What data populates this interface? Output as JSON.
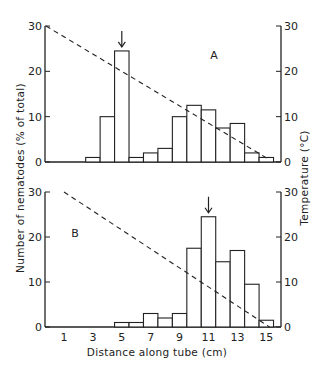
{
  "chart_data": {
    "type": "bar",
    "xlabel": "Distance along tube (cm)",
    "ylabel_left": "Number of nematodes (% of total)",
    "ylabel_right": "Temperature (°C)",
    "x_tick_labels": [
      "1",
      "3",
      "5",
      "7",
      "9",
      "11",
      "13",
      "15"
    ],
    "x_range": [
      0.5,
      15.5
    ],
    "panels": [
      {
        "label": "A",
        "ylim": [
          0,
          30
        ],
        "y_ticks": [
          "0",
          "10",
          "20",
          "30"
        ],
        "y2_ticks": [
          "0",
          "10",
          "20",
          "30"
        ],
        "categories": [
          3,
          4,
          5,
          6,
          7,
          8,
          9,
          10,
          11,
          12,
          13,
          14,
          15
        ],
        "values": [
          1,
          10,
          24.5,
          1,
          2,
          3,
          10,
          12.5,
          11.5,
          7.5,
          8.5,
          2,
          1
        ],
        "arrow_at": 5,
        "temperature_line": {
          "style": "dashed",
          "from": {
            "x": 0.5,
            "temp": 30
          },
          "to": {
            "x": 15.5,
            "temp": 0.5
          }
        }
      },
      {
        "label": "B",
        "ylim": [
          0,
          30
        ],
        "y_ticks": [
          "0",
          "10",
          "20",
          "30"
        ],
        "y2_ticks": [
          "0",
          "10",
          "20",
          "30"
        ],
        "categories": [
          5,
          6,
          7,
          8,
          9,
          10,
          11,
          12,
          13,
          14,
          15
        ],
        "values": [
          1,
          1,
          3,
          2,
          3,
          17.5,
          24.5,
          14.5,
          17,
          9.5,
          1.5
        ],
        "arrow_at": 11,
        "temperature_line": {
          "style": "dashed",
          "from": {
            "x": 1,
            "temp": 30
          },
          "to": {
            "x": 15.5,
            "temp": 0
          }
        }
      }
    ]
  },
  "colors": {
    "ink": "#222222",
    "background": "#ffffff"
  }
}
